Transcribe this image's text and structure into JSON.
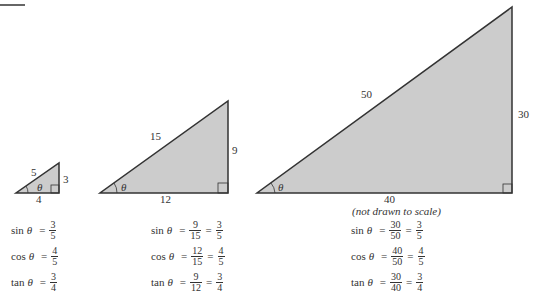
{
  "figure": {
    "caption_note": "(not drawn to scale)",
    "colors": {
      "fill": "#cccccc",
      "stroke": "#333333"
    },
    "triangles": [
      {
        "name": "small",
        "hypotenuse": "5",
        "opposite": "3",
        "adjacent": "4",
        "angle": "θ",
        "equations": {
          "sin": {
            "fn": "sin",
            "angle": "θ",
            "fracs": [
              {
                "num": "3",
                "den": "5"
              }
            ]
          },
          "cos": {
            "fn": "cos",
            "angle": "θ",
            "fracs": [
              {
                "num": "4",
                "den": "5"
              }
            ]
          },
          "tan": {
            "fn": "tan",
            "angle": "θ",
            "fracs": [
              {
                "num": "3",
                "den": "4"
              }
            ]
          }
        }
      },
      {
        "name": "medium",
        "hypotenuse": "15",
        "opposite": "9",
        "adjacent": "12",
        "angle": "θ",
        "equations": {
          "sin": {
            "fn": "sin",
            "angle": "θ",
            "fracs": [
              {
                "num": "9",
                "den": "15"
              },
              {
                "num": "3",
                "den": "5"
              }
            ]
          },
          "cos": {
            "fn": "cos",
            "angle": "θ",
            "fracs": [
              {
                "num": "12",
                "den": "15"
              },
              {
                "num": "4",
                "den": "5"
              }
            ]
          },
          "tan": {
            "fn": "tan",
            "angle": "θ",
            "fracs": [
              {
                "num": "9",
                "den": "12"
              },
              {
                "num": "3",
                "den": "4"
              }
            ]
          }
        }
      },
      {
        "name": "large",
        "hypotenuse": "50",
        "opposite": "30",
        "adjacent": "40",
        "angle": "θ",
        "equations": {
          "sin": {
            "fn": "sin",
            "angle": "θ",
            "fracs": [
              {
                "num": "30",
                "den": "50"
              },
              {
                "num": "3",
                "den": "5"
              }
            ]
          },
          "cos": {
            "fn": "cos",
            "angle": "θ",
            "fracs": [
              {
                "num": "40",
                "den": "50"
              },
              {
                "num": "4",
                "den": "5"
              }
            ]
          },
          "tan": {
            "fn": "tan",
            "angle": "θ",
            "fracs": [
              {
                "num": "30",
                "den": "40"
              },
              {
                "num": "3",
                "den": "4"
              }
            ]
          }
        }
      }
    ],
    "equals": "="
  }
}
